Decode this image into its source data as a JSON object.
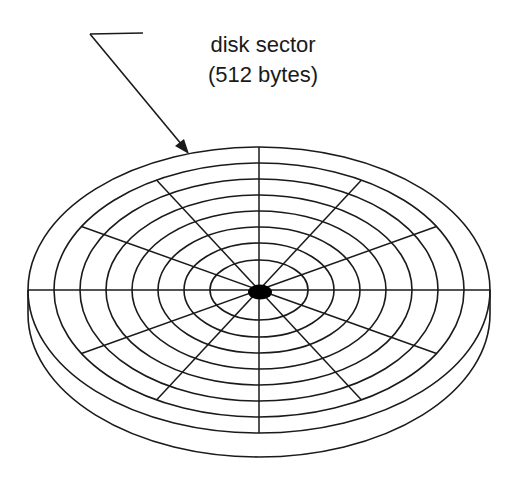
{
  "diagram": {
    "label": {
      "line1": "disk sector",
      "line2": "(512 bytes)"
    },
    "colors": {
      "stroke": "#1a1a1a",
      "background": "#ffffff",
      "spindle": "#000000"
    },
    "disk": {
      "center": [
        259,
        290
      ],
      "track_count": 8,
      "track_radii_x": [
        231,
        205,
        179,
        153,
        127,
        101,
        75,
        49
      ],
      "track_radii_y": [
        143,
        127,
        111,
        95,
        79,
        63,
        47,
        30
      ],
      "spoke_count": 12,
      "thickness_px": 24
    }
  }
}
